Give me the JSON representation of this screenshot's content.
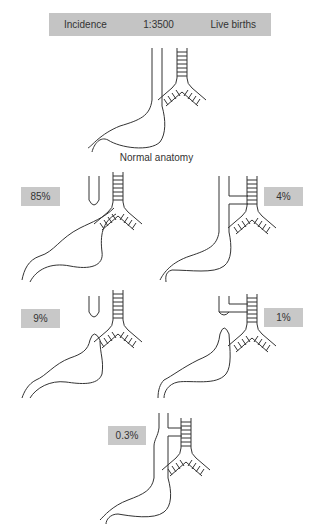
{
  "banner": {
    "label": "Incidence",
    "ratio": "1:3500",
    "unit": "Live births"
  },
  "normal": {
    "caption": "Normal anatomy"
  },
  "variants": [
    {
      "id": "a",
      "percent": "85%",
      "description": "Proximal atresia with distal tracheoesophageal fistula"
    },
    {
      "id": "b",
      "percent": "4%",
      "description": "Proximal and distal fistulae"
    },
    {
      "id": "c",
      "percent": "9%",
      "description": "Isolated atresia without fistula"
    },
    {
      "id": "d",
      "percent": "1%",
      "description": "Proximal fistula with distal pouch"
    },
    {
      "id": "e",
      "percent": "0.3%",
      "description": "H-type fistula without atresia"
    }
  ],
  "colors": {
    "label_bg": "#c8c8c8",
    "line": "#333333"
  }
}
